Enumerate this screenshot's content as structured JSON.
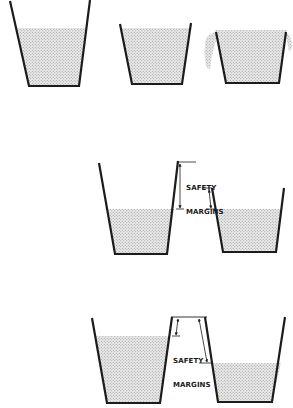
{
  "figure": {
    "colors": {
      "stroke": "#1c1c1c",
      "fill_dot": "#9a9a9a",
      "fill_bg": "#e8e8e8",
      "background": "#ffffff"
    }
  },
  "rows": [
    {
      "name": "row-1",
      "cups": [
        {
          "name": "cup-1",
          "state": "filled-with-headroom"
        },
        {
          "name": "cup-2",
          "state": "filled-to-brim"
        },
        {
          "name": "cup-3",
          "state": "overflowing"
        }
      ]
    },
    {
      "name": "row-2",
      "cups": [
        {
          "name": "cup-4",
          "state": "filled-with-margin"
        },
        {
          "name": "cup-5",
          "state": "filled-with-margin"
        }
      ],
      "annotation": {
        "line1": "SAFETY",
        "line2": "MARGINS"
      }
    },
    {
      "name": "row-3",
      "cups": [
        {
          "name": "cup-6",
          "state": "filled-with-margin"
        },
        {
          "name": "cup-7",
          "state": "filled-with-larger-margin"
        }
      ],
      "annotation": {
        "line1": "SAFETY",
        "line2": "MARGINS"
      }
    }
  ]
}
